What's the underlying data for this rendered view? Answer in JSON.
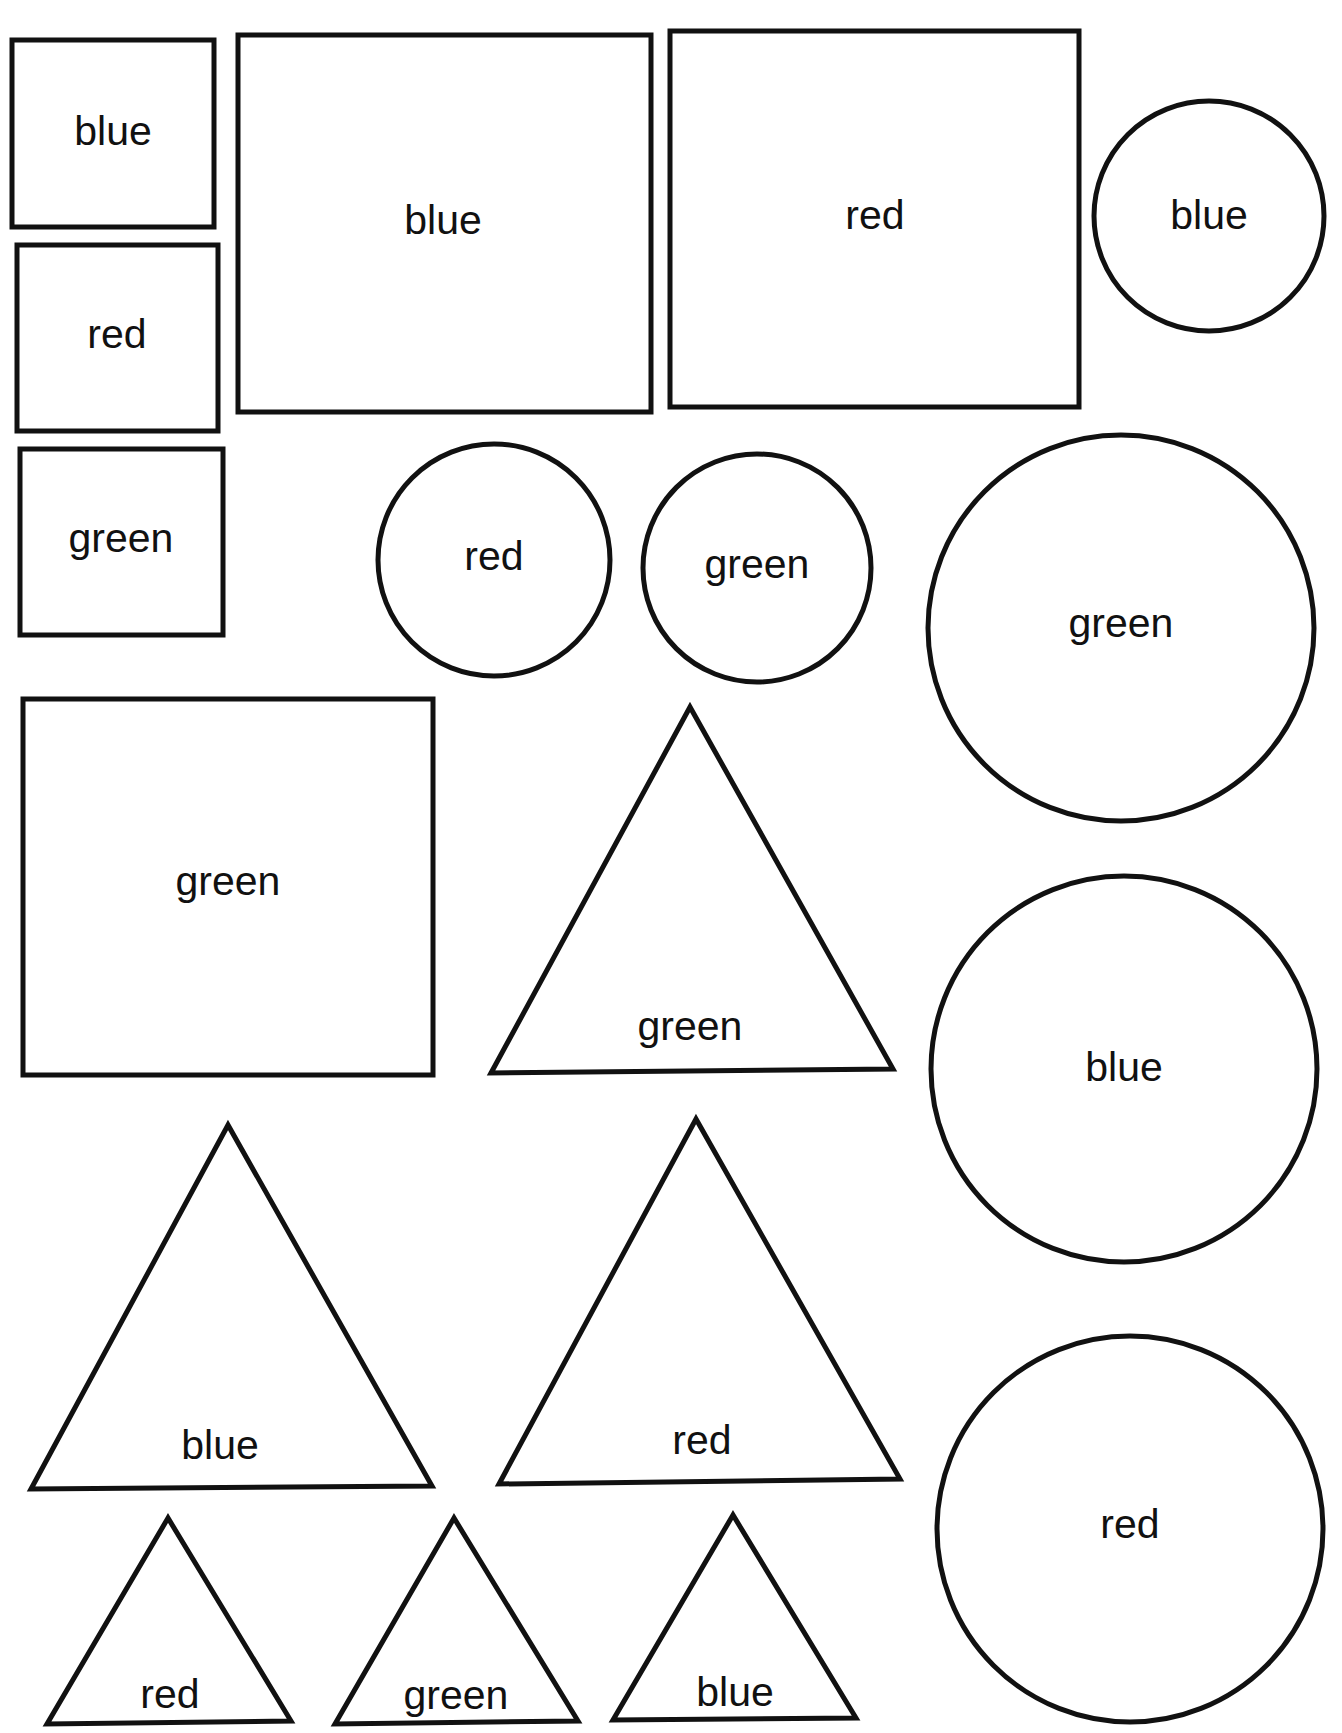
{
  "page": {
    "background": "#ffffff",
    "ink_color": "#111111"
  },
  "shapes": [
    {
      "id": "s1",
      "type": "rect",
      "label": "blue",
      "x": 12,
      "y": 40,
      "w": 202,
      "h": 187,
      "lx": 113,
      "ly": 145
    },
    {
      "id": "s2",
      "type": "rect",
      "label": "red",
      "x": 17,
      "y": 245,
      "w": 201,
      "h": 186,
      "lx": 117,
      "ly": 348
    },
    {
      "id": "s3",
      "type": "rect",
      "label": "green",
      "x": 20,
      "y": 449,
      "w": 203,
      "h": 186,
      "lx": 121,
      "ly": 552
    },
    {
      "id": "s4",
      "type": "rect",
      "label": "blue",
      "x": 238,
      "y": 35,
      "w": 413,
      "h": 377,
      "lx": 443,
      "ly": 234
    },
    {
      "id": "s5",
      "type": "rect",
      "label": "red",
      "x": 670,
      "y": 31,
      "w": 409,
      "h": 376,
      "lx": 875,
      "ly": 229
    },
    {
      "id": "s6",
      "type": "circle",
      "label": "blue",
      "cx": 1209,
      "cy": 216,
      "r": 115,
      "lx": 1209,
      "ly": 229
    },
    {
      "id": "s7",
      "type": "circle",
      "label": "red",
      "cx": 494,
      "cy": 560,
      "r": 116,
      "lx": 494,
      "ly": 570
    },
    {
      "id": "s8",
      "type": "circle",
      "label": "green",
      "cx": 757,
      "cy": 568,
      "r": 114,
      "lx": 757,
      "ly": 578
    },
    {
      "id": "s9",
      "type": "circle",
      "label": "green",
      "cx": 1121,
      "cy": 628,
      "r": 193,
      "lx": 1121,
      "ly": 637
    },
    {
      "id": "s10",
      "type": "rect",
      "label": "green",
      "x": 23,
      "y": 699,
      "w": 410,
      "h": 376,
      "lx": 228,
      "ly": 895
    },
    {
      "id": "s11",
      "type": "triangle",
      "label": "green",
      "points": [
        [
          690,
          707
        ],
        [
          491,
          1073
        ],
        [
          893,
          1069
        ]
      ],
      "lx": 690,
      "ly": 1040
    },
    {
      "id": "s12",
      "type": "circle",
      "label": "blue",
      "cx": 1124,
      "cy": 1069,
      "r": 193,
      "lx": 1124,
      "ly": 1081
    },
    {
      "id": "s13",
      "type": "triangle",
      "label": "blue",
      "points": [
        [
          228,
          1125
        ],
        [
          31,
          1489
        ],
        [
          432,
          1486
        ]
      ],
      "lx": 220,
      "ly": 1459
    },
    {
      "id": "s14",
      "type": "triangle",
      "label": "red",
      "points": [
        [
          696,
          1119
        ],
        [
          499,
          1484
        ],
        [
          900,
          1479
        ]
      ],
      "lx": 702,
      "ly": 1454
    },
    {
      "id": "s15",
      "type": "circle",
      "label": "red",
      "cx": 1130,
      "cy": 1529,
      "r": 193,
      "lx": 1130,
      "ly": 1538
    },
    {
      "id": "s16",
      "type": "triangle",
      "label": "red",
      "points": [
        [
          168,
          1518
        ],
        [
          47,
          1724
        ],
        [
          291,
          1721
        ]
      ],
      "lx": 170,
      "ly": 1708
    },
    {
      "id": "s17",
      "type": "triangle",
      "label": "green",
      "points": [
        [
          454,
          1518
        ],
        [
          335,
          1724
        ],
        [
          578,
          1721
        ]
      ],
      "lx": 456,
      "ly": 1709
    },
    {
      "id": "s18",
      "type": "triangle",
      "label": "blue",
      "points": [
        [
          733,
          1515
        ],
        [
          613,
          1720
        ],
        [
          856,
          1718
        ]
      ],
      "lx": 735,
      "ly": 1706
    }
  ]
}
